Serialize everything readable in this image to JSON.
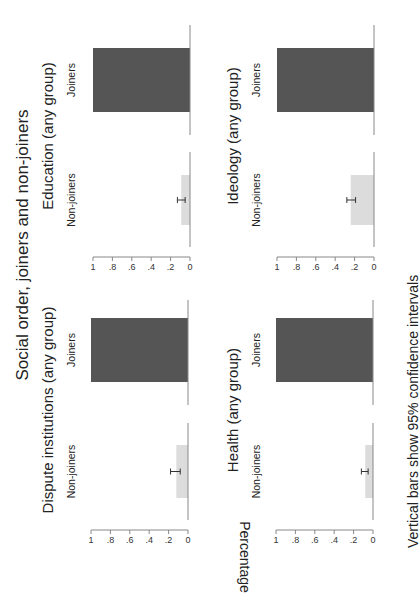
{
  "chart_data": {
    "type": "bar",
    "title": "Social order, joiners and non-joiners",
    "ylabel": "Percentage",
    "note": "Vertical bars show 95% confidence intervals",
    "ylim": [
      0,
      1
    ],
    "yticks": [
      0,
      0.2,
      0.4,
      0.6,
      0.8,
      1
    ],
    "ytick_labels": [
      "0",
      ".2",
      ".4",
      ".6",
      ".8",
      "1"
    ],
    "categories": [
      "Non-joiners",
      "Joiners"
    ],
    "colors": {
      "Non-joiners": "#dcdcdc",
      "Joiners": "#555555",
      "axis": "#888888",
      "ci": "#333333"
    },
    "grid": false,
    "panels": [
      {
        "title": "Dispute institutions (any group)",
        "values": [
          0.12,
          1.0
        ],
        "ci": [
          [
            0.08,
            0.18
          ],
          null
        ]
      },
      {
        "title": "Education (any group)",
        "values": [
          0.09,
          1.0
        ],
        "ci": [
          [
            0.05,
            0.13
          ],
          null
        ]
      },
      {
        "title": "Health (any group)",
        "values": [
          0.08,
          1.0
        ],
        "ci": [
          [
            0.05,
            0.12
          ],
          null
        ]
      },
      {
        "title": "Ideology (any group)",
        "values": [
          0.24,
          1.0
        ],
        "ci": [
          [
            0.19,
            0.28
          ],
          null
        ]
      }
    ]
  }
}
